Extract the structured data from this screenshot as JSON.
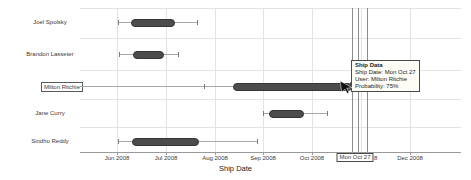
{
  "chart_data": {
    "type": "box",
    "title": "",
    "xlabel": "Ship Date",
    "x_ticks": [
      {
        "label": "Jun 2008",
        "x": 117
      },
      {
        "label": "Jul 2008",
        "x": 166
      },
      {
        "label": "Aug 2008",
        "x": 215
      },
      {
        "label": "Sep 2008",
        "x": 263
      },
      {
        "label": "Oct 2008",
        "x": 312
      },
      {
        "label": "Dec 2008",
        "x": 410
      }
    ],
    "special_tick": {
      "label": "Mon Oct 27",
      "x": 355,
      "remnant_text": "8",
      "remnant_x": 374
    },
    "categories": [
      "Joel Spolsky",
      "Brandon Lasseter",
      "Milton Ritchie",
      "Jane Curry",
      "Sindhu Reddy"
    ],
    "rows": [
      {
        "label": "Joel Spolsky",
        "y": 22,
        "line": [
          118,
          197
        ],
        "caps": [
          118,
          197
        ],
        "box": [
          131,
          173
        ],
        "arrow": null,
        "selected": false,
        "est_range": "Jun 1 - Jul 19",
        "est_box": "Jun 9 - Jul 4"
      },
      {
        "label": "Brandon Lasseter",
        "y": 54,
        "line": [
          119,
          178
        ],
        "caps": [
          119,
          178
        ],
        "box": [
          133,
          162
        ],
        "arrow": null,
        "selected": false,
        "est_range": "Jun 1 - Jul 7",
        "est_box": "Jun 10 - Jun 28"
      },
      {
        "label": "Milton Ritchie",
        "y": 86,
        "line": [
          80,
          233
        ],
        "caps": [
          204
        ],
        "box": [
          233,
          350
        ],
        "arrow": 356,
        "selected": true,
        "est_range": "Jul 24 - Oct 27",
        "est_box": "Aug 11 - Oct 27"
      },
      {
        "label": "Jane Curry",
        "y": 113,
        "line": [
          263,
          327
        ],
        "caps": [
          263,
          327
        ],
        "box": [
          269,
          302
        ],
        "arrow": null,
        "selected": false,
        "est_range": "Sep 1 - Oct 10",
        "est_box": "Sep 4 - Sep 24"
      },
      {
        "label": "Sindhu Reddy",
        "y": 141,
        "line": [
          118,
          257
        ],
        "caps": [
          118,
          257
        ],
        "box": [
          132,
          197
        ],
        "arrow": null,
        "selected": false,
        "est_range": "Jun 1 - Aug 27",
        "est_box": "Jun 10 - Jul 19"
      }
    ],
    "reference_lines_x": [
      352,
      358,
      367
    ],
    "grid": {
      "hgrid_y": [
        8,
        38,
        70,
        99,
        127
      ],
      "vgrid_x": [
        117,
        166,
        215,
        263,
        312,
        361,
        410
      ],
      "plot_left": 80,
      "plot_right": 461,
      "plot_top": 8,
      "axis_y": 152
    },
    "selected_point": {
      "user": "Milton Ritchie",
      "date": "Mon Oct 27",
      "probability": "75%"
    }
  },
  "tooltip": {
    "x": 351,
    "y": 60,
    "title": "Ship Data",
    "lines": [
      "Ship Date: Mon Oct 27",
      "User: Milton Ritchie",
      "Probability: 75%"
    ]
  },
  "axis_title": "Ship Date",
  "colors": {
    "box_fill": "#4c4c4c",
    "box_border": "#353535",
    "whisker": "#a9a9a9",
    "gridline": "#e3e3e3",
    "reference_line": "#8c8c8c",
    "axis": "#9a9a9a",
    "text": "#3a3a3a"
  }
}
